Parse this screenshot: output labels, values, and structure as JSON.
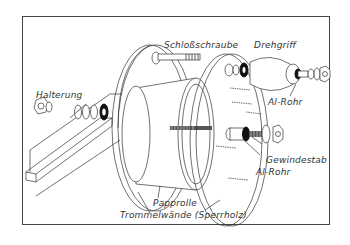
{
  "diagram": {
    "type": "exploded-assembly-drawing",
    "labels": {
      "halterung": "Halterung",
      "schlossschraube": "Schloßschraube",
      "drehgriff": "Drehgriff",
      "al_rohr_top": "Al-Rohr",
      "gewindestab": "Gewindestab",
      "al_rohr_bottom": "Al-Rohr",
      "papprolle": "Papprolle",
      "trommelwaende": "Trommelwände (Sperrholz)"
    },
    "colors": {
      "line": "#333333",
      "frame": "#444444",
      "background": "#ffffff"
    }
  }
}
